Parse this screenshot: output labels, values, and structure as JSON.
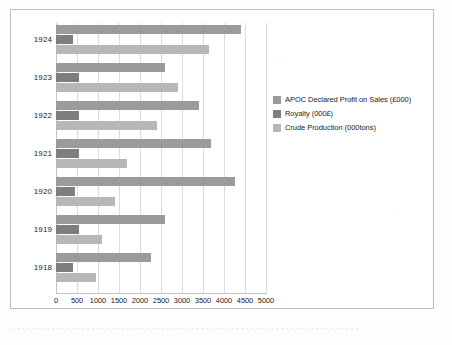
{
  "chart_data": {
    "type": "bar",
    "orientation": "horizontal",
    "title": "",
    "xlabel": "",
    "ylabel": "",
    "categories": [
      "1918",
      "1919",
      "1920",
      "1921",
      "1922",
      "1923",
      "1924"
    ],
    "category_order_top_to_bottom": [
      "1924",
      "1923",
      "1922",
      "1921",
      "1920",
      "1919",
      "1918"
    ],
    "series": [
      {
        "name": "APOC Declared Profit on Sales (£000)",
        "color": "#9b9b9b",
        "values": [
          2250,
          2600,
          4250,
          3700,
          3400,
          2600,
          4400
        ]
      },
      {
        "name": "Royalty (000£)",
        "color": "#7e7e7e",
        "values": [
          400,
          550,
          450,
          550,
          550,
          550,
          400
        ]
      },
      {
        "name": "Crude Production (000tons)",
        "color": "#b7b7b7",
        "values": [
          950,
          1100,
          1400,
          1700,
          2400,
          2900,
          3650
        ]
      }
    ],
    "xlim": [
      0,
      5000
    ],
    "xticks": [
      0,
      500,
      1000,
      1500,
      2000,
      2500,
      3000,
      3500,
      4000,
      4500,
      5000
    ],
    "xtick_labels": [
      "0",
      "500",
      "1000",
      "1500",
      "2000",
      "2500",
      "3000",
      "3500",
      "4000",
      "4500",
      "5000"
    ],
    "grid": true,
    "grid_axis": "x",
    "legend_position": "right"
  },
  "legend": {
    "entries": [
      {
        "label": "APOC Declared Profit on Sales (£000)",
        "swatch": "series-profit"
      },
      {
        "label": "Royalty (000£)",
        "swatch": "series-royalty"
      },
      {
        "label": "Crude Production (000tons)",
        "swatch": "series-crude"
      }
    ]
  },
  "caption": {
    "text": "· · · · · · · · · · · · · · · · · · · · · · · · · · · · · · · · · · · · · · · · · · · · · · · · · · · · · · · · · · · · · · · · · · · · · ·"
  }
}
